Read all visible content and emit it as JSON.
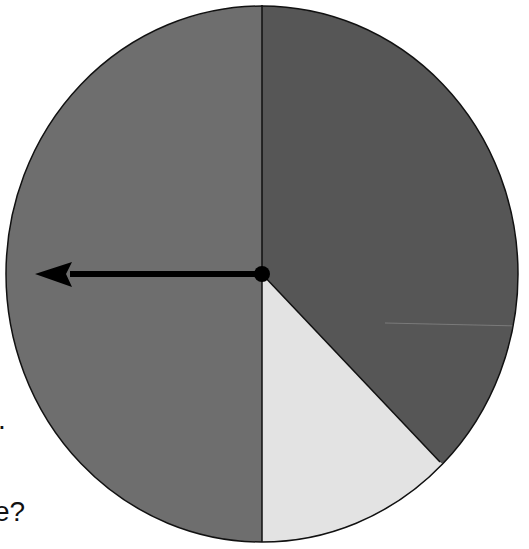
{
  "spinner": {
    "center": [
      262,
      274
    ],
    "rx": 256,
    "ry": 268,
    "sections": [
      {
        "name": "left-half",
        "color": "#6e6e6e",
        "start_deg": 180,
        "end_deg": 360
      },
      {
        "name": "right-dark",
        "color": "#565656",
        "start_deg": 0,
        "end_deg": 146
      },
      {
        "name": "light-wedge",
        "color": "#e3e3e3",
        "start_deg": 146,
        "end_deg": 180
      }
    ],
    "arrow_direction": "left",
    "outline_color": "#111111"
  },
  "text_fragments": {
    "period": ".",
    "question": "e?"
  }
}
